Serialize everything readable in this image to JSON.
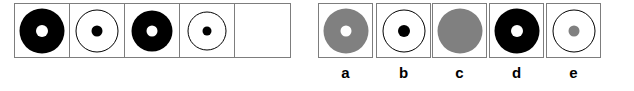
{
  "puzzle": {
    "type": "visual-analogy-sequence",
    "colors": {
      "black": "#000000",
      "white": "#ffffff",
      "gray": "#808080",
      "box_border": "#7d7d7d",
      "outline": "#000000",
      "background": "#ffffff"
    },
    "sequence": {
      "name": "sequence-strip",
      "cells": [
        {
          "id": "seq-1",
          "empty": false,
          "outer": {
            "shape": "circle",
            "fill": "#000000",
            "stroke": "#000000",
            "diameter": 45
          },
          "inner": {
            "shape": "circle",
            "fill": "#ffffff",
            "stroke": "none",
            "diameter": 12
          }
        },
        {
          "id": "seq-2",
          "empty": false,
          "outer": {
            "shape": "circle",
            "fill": "#ffffff",
            "stroke": "#000000",
            "diameter": 43
          },
          "inner": {
            "shape": "circle",
            "fill": "#000000",
            "stroke": "none",
            "diameter": 11
          }
        },
        {
          "id": "seq-3",
          "empty": false,
          "outer": {
            "shape": "circle",
            "fill": "#000000",
            "stroke": "#000000",
            "diameter": 41
          },
          "inner": {
            "shape": "circle",
            "fill": "#ffffff",
            "stroke": "none",
            "diameter": 11
          }
        },
        {
          "id": "seq-4",
          "empty": false,
          "outer": {
            "shape": "circle",
            "fill": "#ffffff",
            "stroke": "#000000",
            "diameter": 39
          },
          "inner": {
            "shape": "circle",
            "fill": "#000000",
            "stroke": "none",
            "diameter": 9
          }
        },
        {
          "id": "seq-5-answer-slot",
          "empty": true,
          "outer": null,
          "inner": null
        }
      ]
    },
    "options": {
      "name": "answer-options",
      "items": [
        {
          "id": "option-a",
          "label": "a",
          "outer": {
            "shape": "circle",
            "fill": "#808080",
            "stroke": "#808080",
            "diameter": 45
          },
          "inner": {
            "shape": "circle",
            "fill": "#ffffff",
            "stroke": "none",
            "diameter": 11
          }
        },
        {
          "id": "option-b",
          "label": "b",
          "outer": {
            "shape": "circle",
            "fill": "#ffffff",
            "stroke": "#000000",
            "diameter": 43
          },
          "inner": {
            "shape": "circle",
            "fill": "#000000",
            "stroke": "none",
            "diameter": 12
          }
        },
        {
          "id": "option-c",
          "label": "c",
          "outer": {
            "shape": "circle",
            "fill": "#808080",
            "stroke": "#808080",
            "diameter": 45
          },
          "inner": null
        },
        {
          "id": "option-d",
          "label": "d",
          "outer": {
            "shape": "circle",
            "fill": "#000000",
            "stroke": "#000000",
            "diameter": 45
          },
          "inner": {
            "shape": "circle",
            "fill": "#ffffff",
            "stroke": "none",
            "diameter": 12
          }
        },
        {
          "id": "option-e",
          "label": "e",
          "outer": {
            "shape": "circle",
            "fill": "#ffffff",
            "stroke": "#000000",
            "diameter": 43
          },
          "inner": {
            "shape": "circle",
            "fill": "#808080",
            "stroke": "none",
            "diameter": 11
          }
        }
      ]
    }
  }
}
